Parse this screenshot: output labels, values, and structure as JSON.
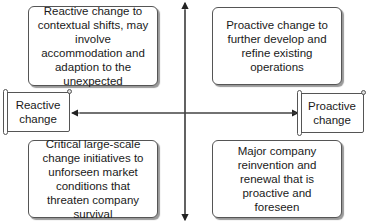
{
  "diagram": {
    "type": "quadrant",
    "axis": {
      "left_label": "Reactive change",
      "right_label": "Proactive change"
    },
    "quadrants": {
      "top_left": "Reactive change to contextual shifts, may involve accommodation and adaption to the unexpected",
      "top_right": "Proactive change to further develop and refine existing operations",
      "bottom_left": "Critical large-scale change initiatives to unforseen market conditions that threaten company survival",
      "bottom_right": "Major company reinvention and renewal that is proactive and foreseen"
    },
    "colors": {
      "line": "#333333",
      "border": "#555555",
      "background": "#ffffff"
    }
  }
}
